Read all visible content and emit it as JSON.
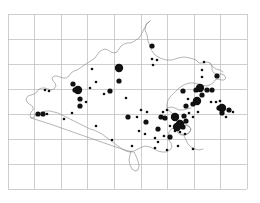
{
  "figure": {
    "kind": "distribution-map",
    "title": "",
    "subtitle": "",
    "region_name": "",
    "background_color": "#ffffff",
    "outline_color": "#8d8d8d",
    "grid_color": "#b9b9b9",
    "dot_color": "#111111"
  },
  "chart_data": {
    "type": "scatter",
    "title": "",
    "xlabel": "",
    "ylabel": "",
    "grid": true,
    "legend": "none",
    "xlim": [
      0,
      9
    ],
    "ylim": [
      0,
      7
    ],
    "grid_spec": {
      "columns": 9,
      "rows": 7,
      "x_start_px": 8,
      "y_start_px": 14,
      "cell_width_px": 26.6,
      "cell_height_px": 25.0
    },
    "size_classes": [
      {
        "name": "small",
        "radius_px": 1.3
      },
      {
        "name": "medium",
        "radius_px": 2.6
      },
      {
        "name": "large",
        "radius_px": 4.2
      }
    ],
    "points": [
      {
        "x": 152,
        "y": 46,
        "size": "medium"
      },
      {
        "x": 152,
        "y": 59,
        "size": "small"
      },
      {
        "x": 157,
        "y": 60,
        "size": "small"
      },
      {
        "x": 153,
        "y": 65,
        "size": "small"
      },
      {
        "x": 204,
        "y": 62,
        "size": "small"
      },
      {
        "x": 202,
        "y": 70,
        "size": "small"
      },
      {
        "x": 202,
        "y": 77,
        "size": "small"
      },
      {
        "x": 217,
        "y": 76,
        "size": "medium"
      },
      {
        "x": 119,
        "y": 68,
        "size": "large"
      },
      {
        "x": 119,
        "y": 81,
        "size": "medium"
      },
      {
        "x": 92,
        "y": 69,
        "size": "small"
      },
      {
        "x": 96,
        "y": 82,
        "size": "small"
      },
      {
        "x": 110,
        "y": 91,
        "size": "medium"
      },
      {
        "x": 90,
        "y": 88,
        "size": "small"
      },
      {
        "x": 78,
        "y": 90,
        "size": "large"
      },
      {
        "x": 75,
        "y": 90,
        "size": "medium"
      },
      {
        "x": 73,
        "y": 84,
        "size": "medium"
      },
      {
        "x": 80,
        "y": 99,
        "size": "medium"
      },
      {
        "x": 86,
        "y": 102,
        "size": "small"
      },
      {
        "x": 80,
        "y": 106,
        "size": "medium"
      },
      {
        "x": 72,
        "y": 113,
        "size": "small"
      },
      {
        "x": 45,
        "y": 90,
        "size": "small"
      },
      {
        "x": 49,
        "y": 91,
        "size": "small"
      },
      {
        "x": 38,
        "y": 114,
        "size": "medium"
      },
      {
        "x": 43,
        "y": 114,
        "size": "medium"
      },
      {
        "x": 47,
        "y": 114,
        "size": "small"
      },
      {
        "x": 96,
        "y": 126,
        "size": "small"
      },
      {
        "x": 128,
        "y": 117,
        "size": "medium"
      },
      {
        "x": 137,
        "y": 117,
        "size": "small"
      },
      {
        "x": 146,
        "y": 122,
        "size": "medium"
      },
      {
        "x": 139,
        "y": 131,
        "size": "small"
      },
      {
        "x": 145,
        "y": 134,
        "size": "small"
      },
      {
        "x": 158,
        "y": 129,
        "size": "medium"
      },
      {
        "x": 155,
        "y": 138,
        "size": "small"
      },
      {
        "x": 158,
        "y": 142,
        "size": "small"
      },
      {
        "x": 164,
        "y": 136,
        "size": "small"
      },
      {
        "x": 170,
        "y": 137,
        "size": "medium"
      },
      {
        "x": 161,
        "y": 117,
        "size": "medium"
      },
      {
        "x": 165,
        "y": 118,
        "size": "medium"
      },
      {
        "x": 163,
        "y": 112,
        "size": "small"
      },
      {
        "x": 167,
        "y": 110,
        "size": "small"
      },
      {
        "x": 175,
        "y": 117,
        "size": "large"
      },
      {
        "x": 180,
        "y": 124,
        "size": "large"
      },
      {
        "x": 177,
        "y": 127,
        "size": "large"
      },
      {
        "x": 183,
        "y": 127,
        "size": "medium"
      },
      {
        "x": 175,
        "y": 131,
        "size": "small"
      },
      {
        "x": 180,
        "y": 132,
        "size": "small"
      },
      {
        "x": 185,
        "y": 134,
        "size": "small"
      },
      {
        "x": 170,
        "y": 126,
        "size": "small"
      },
      {
        "x": 186,
        "y": 121,
        "size": "medium"
      },
      {
        "x": 184,
        "y": 116,
        "size": "medium"
      },
      {
        "x": 189,
        "y": 113,
        "size": "small"
      },
      {
        "x": 178,
        "y": 146,
        "size": "small"
      },
      {
        "x": 193,
        "y": 149,
        "size": "small"
      },
      {
        "x": 186,
        "y": 106,
        "size": "medium"
      },
      {
        "x": 193,
        "y": 104,
        "size": "medium"
      },
      {
        "x": 188,
        "y": 99,
        "size": "small"
      },
      {
        "x": 183,
        "y": 91,
        "size": "medium"
      },
      {
        "x": 196,
        "y": 90,
        "size": "medium"
      },
      {
        "x": 200,
        "y": 88,
        "size": "large"
      },
      {
        "x": 202,
        "y": 95,
        "size": "medium"
      },
      {
        "x": 197,
        "y": 101,
        "size": "large"
      },
      {
        "x": 207,
        "y": 90,
        "size": "medium"
      },
      {
        "x": 212,
        "y": 90,
        "size": "medium"
      },
      {
        "x": 211,
        "y": 102,
        "size": "small"
      },
      {
        "x": 216,
        "y": 102,
        "size": "small"
      },
      {
        "x": 220,
        "y": 101,
        "size": "small"
      },
      {
        "x": 219,
        "y": 108,
        "size": "medium"
      },
      {
        "x": 222,
        "y": 108,
        "size": "large"
      },
      {
        "x": 222,
        "y": 113,
        "size": "medium"
      },
      {
        "x": 229,
        "y": 110,
        "size": "medium"
      },
      {
        "x": 233,
        "y": 112,
        "size": "small"
      },
      {
        "x": 226,
        "y": 117,
        "size": "small"
      },
      {
        "x": 198,
        "y": 112,
        "size": "small"
      },
      {
        "x": 193,
        "y": 117,
        "size": "small"
      },
      {
        "x": 112,
        "y": 140,
        "size": "small"
      },
      {
        "x": 141,
        "y": 110,
        "size": "small"
      },
      {
        "x": 147,
        "y": 112,
        "size": "small"
      },
      {
        "x": 104,
        "y": 94,
        "size": "small"
      },
      {
        "x": 126,
        "y": 98,
        "size": "small"
      },
      {
        "x": 64,
        "y": 119,
        "size": "small"
      },
      {
        "x": 132,
        "y": 146,
        "size": "small"
      },
      {
        "x": 167,
        "y": 150,
        "size": "small"
      },
      {
        "x": 155,
        "y": 148,
        "size": "small"
      }
    ]
  }
}
